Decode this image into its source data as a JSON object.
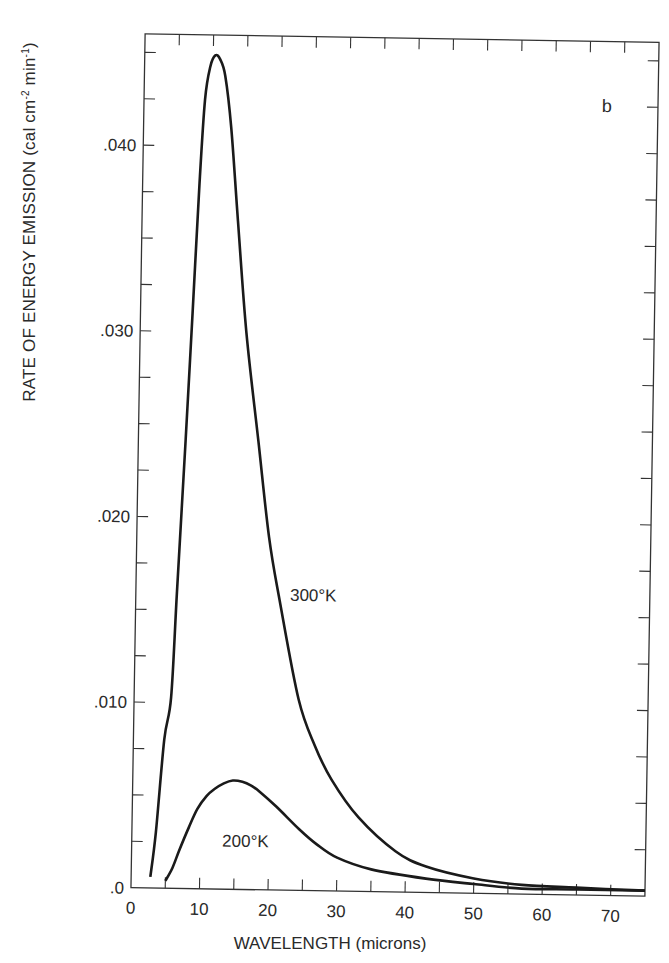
{
  "chart_data": {
    "type": "line",
    "title": "",
    "panel_label": "b",
    "xlabel": "WAVELENGTH (microns)",
    "ylabel": "RATE OF ENERGY EMISSION (cal cm-2 min-1)",
    "ylabel_parts": {
      "main": "RATE OF ENERGY EMISSION (cal cm",
      "exp1": "-2",
      "mid": " min",
      "exp2": "-1",
      "end": ")"
    },
    "xlim": [
      0,
      75
    ],
    "ylim": [
      0,
      0.046
    ],
    "x_ticks": [
      0,
      10,
      20,
      30,
      40,
      50,
      60,
      70
    ],
    "x_tick_labels": [
      "0",
      "10",
      "20",
      "30",
      "40",
      "50",
      "60",
      "70"
    ],
    "x_minor_step": 5,
    "y_ticks": [
      0,
      0.01,
      0.02,
      0.03,
      0.04
    ],
    "y_tick_labels": [
      ".0",
      ".010",
      ".020",
      ".030",
      ".040"
    ],
    "y_minor_step": 0.0025,
    "grid": false,
    "series": [
      {
        "name": "300°K",
        "label_pos": {
          "x": 22.5,
          "y": 0.0156
        },
        "points": [
          [
            2.8,
            0.0006
          ],
          [
            3.5,
            0.003
          ],
          [
            4.5,
            0.008
          ],
          [
            5.4,
            0.0103
          ],
          [
            6.0,
            0.016
          ],
          [
            6.9,
            0.0242
          ],
          [
            7.6,
            0.031
          ],
          [
            8.3,
            0.038
          ],
          [
            8.9,
            0.0425
          ],
          [
            9.6,
            0.0443
          ],
          [
            10.3,
            0.0449
          ],
          [
            11.0,
            0.0447
          ],
          [
            11.8,
            0.0438
          ],
          [
            12.8,
            0.041
          ],
          [
            14.0,
            0.036
          ],
          [
            15.5,
            0.03
          ],
          [
            17.5,
            0.0242
          ],
          [
            19.3,
            0.019
          ],
          [
            21.0,
            0.0156
          ],
          [
            24.0,
            0.0103
          ],
          [
            26.5,
            0.0078
          ],
          [
            29.0,
            0.006
          ],
          [
            33.0,
            0.004
          ],
          [
            38.5,
            0.0022
          ],
          [
            43.0,
            0.0014
          ],
          [
            50.0,
            0.0008
          ],
          [
            57.0,
            0.0005
          ],
          [
            65.0,
            0.0004
          ],
          [
            75.0,
            0.0003
          ]
        ]
      },
      {
        "name": "200°K",
        "label_pos": {
          "x": 13.2,
          "y": 0.0023
        },
        "points": [
          [
            5.0,
            0.0004
          ],
          [
            6.0,
            0.0011
          ],
          [
            7.0,
            0.0021
          ],
          [
            8.3,
            0.0033
          ],
          [
            9.5,
            0.0043
          ],
          [
            10.8,
            0.005
          ],
          [
            12.0,
            0.0054
          ],
          [
            13.3,
            0.0057
          ],
          [
            14.6,
            0.00586
          ],
          [
            16.0,
            0.0058
          ],
          [
            17.3,
            0.0056
          ],
          [
            18.5,
            0.0053
          ],
          [
            21.0,
            0.0045
          ],
          [
            24.4,
            0.0033
          ],
          [
            27.0,
            0.0025
          ],
          [
            30.0,
            0.0018
          ],
          [
            35.0,
            0.0012
          ],
          [
            43.0,
            0.00075
          ],
          [
            50.0,
            0.0005
          ],
          [
            57.0,
            0.0003
          ],
          [
            65.0,
            0.0003
          ],
          [
            75.0,
            0.0003
          ]
        ]
      }
    ]
  },
  "colors": {
    "line": "#1a1a1a",
    "axis": "#333333",
    "text": "#2a2a2a",
    "background": "#ffffff"
  }
}
